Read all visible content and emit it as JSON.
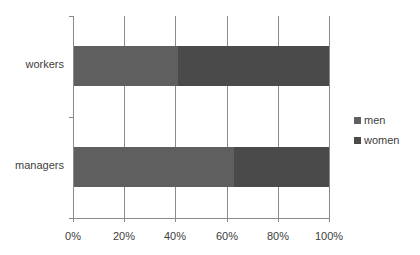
{
  "chart_data": {
    "type": "bar",
    "orientation": "horizontal",
    "stacked": "100%",
    "categories": [
      "workers",
      "managers"
    ],
    "series": [
      {
        "name": "men",
        "values": [
          41,
          63
        ],
        "color": "#5f5f5f"
      },
      {
        "name": "women",
        "values": [
          59,
          37
        ],
        "color": "#4a4a4a"
      }
    ],
    "title": "",
    "xlabel": "",
    "ylabel": "",
    "xlim": [
      0,
      100
    ],
    "x_ticks": [
      "0%",
      "20%",
      "40%",
      "60%",
      "80%",
      "100%"
    ],
    "grid": "vertical",
    "legend_position": "right"
  },
  "categories": {
    "workers": "workers",
    "managers": "managers"
  },
  "x_ticks": [
    "0%",
    "20%",
    "40%",
    "60%",
    "80%",
    "100%"
  ],
  "legend": {
    "men": "men",
    "women": "women"
  }
}
